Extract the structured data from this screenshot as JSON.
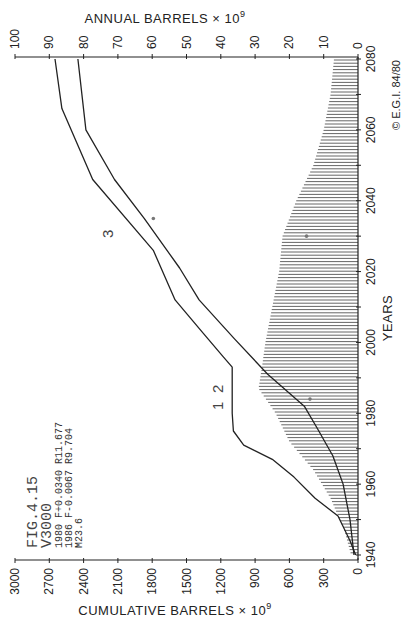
{
  "chart_data": {
    "type": "line",
    "orientation": "rotated-90 (years axis vertical on right, value axes horizontal)",
    "title": "FIG.4.15",
    "annotation_block": [
      "FIG.4.15",
      "V3000",
      "1980 F+0.0340 R11.677",
      "1986 F-0.0067 R9.704",
      "M23.6"
    ],
    "years_axis": {
      "label": "YEARS",
      "range": [
        1940,
        2080
      ],
      "ticks": [
        1940,
        1960,
        1980,
        2000,
        2020,
        2040,
        2060,
        2080
      ]
    },
    "cumulative_axis": {
      "label": "CUMULATIVE BARRELS × 10⁹",
      "range": [
        0,
        3000
      ],
      "ticks": [
        0,
        300,
        600,
        900,
        1200,
        1500,
        1800,
        2100,
        2400,
        2700,
        3000
      ]
    },
    "annual_axis": {
      "label": "ANNUAL BARRELS × 10⁹",
      "range": [
        0,
        100
      ],
      "ticks": [
        0,
        10,
        20,
        30,
        40,
        50,
        60,
        70,
        80,
        90,
        100
      ]
    },
    "series": [
      {
        "name": "Curve 1 – cumulative discovery",
        "label": "1",
        "axis": "cumulative",
        "x": [
          1940,
          1944,
          1951,
          1956,
          1962,
          1967,
          1971,
          1975,
          1980,
          1993,
          1996,
          2004,
          2012,
          2026,
          2046,
          2066,
          2080
        ],
        "values": [
          20,
          70,
          175,
          375,
          560,
          750,
          1000,
          1090,
          1100,
          1100,
          1180,
          1390,
          1600,
          1790,
          2320,
          2590,
          2650
        ]
      },
      {
        "name": "Step segment (discovery plateau)",
        "label": "2",
        "axis": "cumulative",
        "x": [
          1980,
          1993
        ],
        "values": [
          1100,
          1100
        ]
      },
      {
        "name": "Curve 3 – cumulative production",
        "label": "3",
        "axis": "cumulative",
        "x": [
          1940,
          1950,
          1960,
          1968,
          1976,
          1982,
          1991,
          2001,
          2012,
          2021,
          2035,
          2046,
          2060,
          2080
        ],
        "values": [
          35,
          70,
          130,
          220,
          360,
          470,
          790,
          1080,
          1390,
          1560,
          1870,
          2130,
          2380,
          2450
        ]
      },
      {
        "name": "Annual production (hatched area)",
        "axis": "annual",
        "x": [
          1940,
          1947,
          1956,
          1964,
          1972,
          1980,
          1987,
          1993,
          2000,
          2010,
          2020,
          2030,
          2040,
          2050,
          2060,
          2070,
          2080
        ],
        "values": [
          2,
          4,
          8,
          13,
          20,
          24,
          29,
          28,
          27,
          25,
          23,
          22,
          18,
          13,
          10,
          8,
          7
        ]
      }
    ],
    "markers": [
      {
        "series": "Curve 3",
        "year": 2035,
        "value": 1790
      },
      {
        "series": "Annual production",
        "year": 2030,
        "value": 15
      },
      {
        "series": "Annual production",
        "year": 1984,
        "value": 14
      }
    ],
    "grid": false,
    "legend": "none (curves labeled 1, 2, 3 inline)"
  },
  "labels": {
    "annual_title": "ANNUAL  BARRELS × 10",
    "annual_exp": "9",
    "cumulative_title": "CUMULATIVE  BARRELS × 10",
    "cumulative_exp": "9",
    "years_title": "YEARS",
    "copyright": "© E.G.I. 84/80",
    "curve1": "1",
    "curve2": "2",
    "curve3": "3",
    "fig_line1": "FIG.4.15",
    "fig_line2": "V3000",
    "fig_line3": "1980 F+0.0340 R11.677",
    "fig_line4": "1986 F-0.0067 R9.704",
    "fig_line5": "M23.6"
  },
  "colors": {
    "ink": "#222222",
    "hatch": "#555555",
    "background": "#ffffff"
  }
}
